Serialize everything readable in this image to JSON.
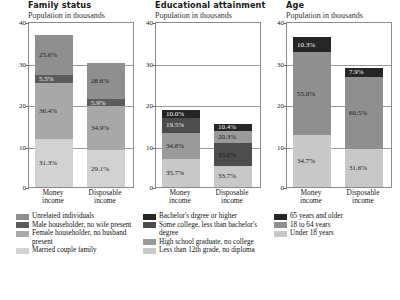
{
  "subtitle_text": "Population in thousands",
  "axis": {
    "ticks": [
      "0",
      "10",
      "20",
      "30",
      "40"
    ],
    "ymin": 0,
    "ymax": 40
  },
  "categories": [
    "Money income",
    "Disposable income"
  ],
  "category_lines": [
    [
      "Money",
      "income"
    ],
    [
      "Disposable",
      "income"
    ]
  ],
  "colors": {
    "c_dark": "#262626",
    "c_darkgray": "#5c5c5c",
    "c_midgray": "#8f8f8f",
    "c_lightgray": "#c8c8c8",
    "c_mid2": "#a8a8a8",
    "border": "#8a8a8a"
  },
  "panels": [
    {
      "title": "Family status",
      "subtitle": "Population in thousands",
      "legend": [
        {
          "label": "Unrelated individuals",
          "color": "#8f8f8f"
        },
        {
          "label": "Male householder, no wife present",
          "color": "#5c5c5c"
        },
        {
          "label": "Female householder, no husband present",
          "color": "#a8a8a8"
        },
        {
          "label": "Married couple family",
          "color": "#d2d2d2"
        }
      ],
      "bars": [
        {
          "category": "Money income",
          "total": 37.0,
          "segments": [
            {
              "label": "Married couple family",
              "value": "31.3%",
              "pct": 31.3,
              "color": "#d2d2d2",
              "text": "#1a1a1a"
            },
            {
              "label": "Female householder, no husband present",
              "value": "36.4%",
              "pct": 36.4,
              "color": "#a8a8a8",
              "text": "#1a1a1a"
            },
            {
              "label": "Male householder, no wife present",
              "value": "5.5%",
              "pct": 5.5,
              "color": "#5c5c5c",
              "text": "#f2f2f2"
            },
            {
              "label": "Unrelated individuals",
              "value": "25.6%",
              "pct": 25.6,
              "color": "#8f8f8f",
              "text": "#1a1a1a"
            }
          ]
        },
        {
          "category": "Disposable income",
          "total": 30.4,
          "segments": [
            {
              "label": "Married couple family",
              "value": "29.1%",
              "pct": 29.1,
              "color": "#d2d2d2",
              "text": "#1a1a1a"
            },
            {
              "label": "Female householder, no husband present",
              "value": "34.9%",
              "pct": 34.9,
              "color": "#a8a8a8",
              "text": "#1a1a1a"
            },
            {
              "label": "Male householder, no wife present",
              "value": "5.9%",
              "pct": 5.9,
              "color": "#5c5c5c",
              "text": "#f2f2f2"
            },
            {
              "label": "Unrelated individuals",
              "value": "28.6%",
              "pct": 28.6,
              "color": "#8f8f8f",
              "text": "#1a1a1a"
            }
          ]
        }
      ]
    },
    {
      "title": "Educational attainment",
      "subtitle": "Population in thousands",
      "legend": [
        {
          "label": "Bachelor's drgree or higher",
          "color": "#262626"
        },
        {
          "label": "Some college, less than bachelor's degree",
          "color": "#4d4d4d"
        },
        {
          "label": "High school graduate, no college",
          "color": "#9a9a9a"
        },
        {
          "label": "Less than 12th grade, no diploma",
          "color": "#c8c8c8"
        }
      ],
      "bars": [
        {
          "category": "Money income",
          "total": 18.6,
          "segments": [
            {
              "label": "Less than 12th grade, no diploma",
              "value": "35.7%",
              "pct": 35.7,
              "color": "#c8c8c8",
              "text": "#1a1a1a"
            },
            {
              "label": "High school graduate, no college",
              "value": "34.8%",
              "pct": 34.8,
              "color": "#9a9a9a",
              "text": "#1a1a1a"
            },
            {
              "label": "Some college, less than bachelor's degree",
              "value": "19.5%",
              "pct": 19.5,
              "color": "#4d4d4d",
              "text": "#ededed"
            },
            {
              "label": "Bachelor's drgree or higher",
              "value": "10.0%",
              "pct": 10.0,
              "color": "#262626",
              "text": "#f5f5f5"
            }
          ]
        },
        {
          "category": "Disposable income",
          "total": 15.2,
          "segments": [
            {
              "label": "Less than 12th grade, no diploma",
              "value": "33.7%",
              "pct": 33.7,
              "color": "#c8c8c8",
              "text": "#1a1a1a"
            },
            {
              "label": "High school graduate, no college",
              "value": "35.6%",
              "pct": 35.6,
              "color": "#4d4d4d",
              "text": "#1a1a1a"
            },
            {
              "label": "Some college, less than bachelor's degree",
              "value": "20.3%",
              "pct": 20.3,
              "color": "#9a9a9a",
              "text": "#1a1a1a"
            },
            {
              "label": "Bachelor's drgree or higher",
              "value": "10.4%",
              "pct": 10.4,
              "color": "#262626",
              "text": "#f5f5f5"
            }
          ]
        }
      ]
    },
    {
      "title": "Age",
      "subtitle": "Population in thousands",
      "legend": [
        {
          "label": "65 years and older",
          "color": "#262626"
        },
        {
          "label": "18 to 64 years",
          "color": "#8f8f8f"
        },
        {
          "label": "Under 18 years",
          "color": "#c8c8c8"
        }
      ],
      "bars": [
        {
          "category": "Money income",
          "total": 36.2,
          "segments": [
            {
              "label": "Under 18 years",
              "value": "34.7%",
              "pct": 34.7,
              "color": "#c8c8c8",
              "text": "#1a1a1a"
            },
            {
              "label": "18 to 64 years",
              "value": "55.0%",
              "pct": 55.0,
              "color": "#8f8f8f",
              "text": "#1a1a1a"
            },
            {
              "label": "65 years and older",
              "value": "10.3%",
              "pct": 10.3,
              "color": "#262626",
              "text": "#f5f5f5"
            }
          ]
        },
        {
          "category": "Disposable income",
          "total": 28.8,
          "segments": [
            {
              "label": "Under 18 years",
              "value": "31.6%",
              "pct": 31.6,
              "color": "#c8c8c8",
              "text": "#1a1a1a"
            },
            {
              "label": "18 to 64 years",
              "value": "60.5%",
              "pct": 60.5,
              "color": "#8f8f8f",
              "text": "#1a1a1a"
            },
            {
              "label": "65 years and older",
              "value": "7.9%",
              "pct": 7.9,
              "color": "#262626",
              "text": "#f5f5f5"
            }
          ]
        }
      ]
    }
  ],
  "chart_data": {
    "type": "bar",
    "subtype": "stacked-100-percent-with-variable-total-height",
    "xlabel": "",
    "ylabel": "Population in thousands",
    "ylim": [
      0,
      40
    ],
    "yticks": [
      0,
      10,
      20,
      30,
      40
    ],
    "grid": true,
    "legend_position": "below-each-panel",
    "categories": [
      "Money income",
      "Disposable income"
    ],
    "panels": [
      {
        "title": "Family status",
        "ylabel": "Population in thousands",
        "series": [
          {
            "name": "Married couple family",
            "values": [
              31.3,
              29.1
            ],
            "unit": "%"
          },
          {
            "name": "Female householder, no husband present",
            "values": [
              36.4,
              34.9
            ],
            "unit": "%"
          },
          {
            "name": "Male householder, no wife present",
            "values": [
              5.5,
              5.9
            ],
            "unit": "%"
          },
          {
            "name": "Unrelated individuals",
            "values": [
              25.6,
              28.6
            ],
            "unit": "%"
          }
        ],
        "bar_totals": [
          37.0,
          30.4
        ]
      },
      {
        "title": "Educational attainment",
        "ylabel": "Population in thousands",
        "series": [
          {
            "name": "Less than 12th grade, no diploma",
            "values": [
              35.7,
              33.7
            ],
            "unit": "%"
          },
          {
            "name": "High school graduate, no college",
            "values": [
              34.8,
              35.6
            ],
            "unit": "%"
          },
          {
            "name": "Some college, less than bachelor's degree",
            "values": [
              19.5,
              20.3
            ],
            "unit": "%"
          },
          {
            "name": "Bachelor's drgree or higher",
            "values": [
              10.0,
              10.4
            ],
            "unit": "%"
          }
        ],
        "bar_totals": [
          18.6,
          15.2
        ]
      },
      {
        "title": "Age",
        "ylabel": "Population in thousands",
        "series": [
          {
            "name": "Under 18 years",
            "values": [
              34.7,
              31.6
            ],
            "unit": "%"
          },
          {
            "name": "18 to 64 years",
            "values": [
              55.0,
              60.5
            ],
            "unit": "%"
          },
          {
            "name": "65 years and older",
            "values": [
              10.3,
              7.9
            ],
            "unit": "%"
          }
        ],
        "bar_totals": [
          36.2,
          28.8
        ]
      }
    ]
  }
}
